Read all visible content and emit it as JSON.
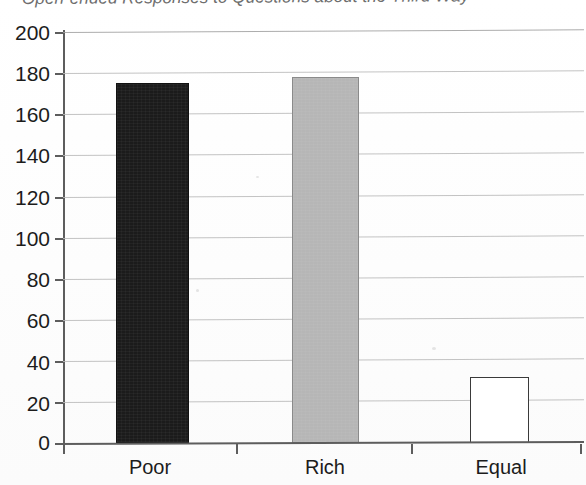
{
  "chart_data": {
    "type": "bar",
    "title": "Open-ended Responses to Questions about the Third Way",
    "xlabel": "",
    "ylabel": "",
    "categories": [
      "Poor",
      "Rich",
      "Equal"
    ],
    "values": [
      175,
      178,
      32
    ],
    "series": [
      {
        "name": "Responses",
        "values": [
          175,
          178,
          32
        ]
      }
    ],
    "ylim": [
      0,
      200
    ],
    "ytick_labels": [
      "200",
      "180",
      "160",
      "140",
      "120",
      "100",
      "80",
      "60",
      "40",
      "20",
      "0"
    ],
    "ytick_values": [
      200,
      180,
      160,
      140,
      120,
      100,
      80,
      60,
      40,
      20,
      0
    ],
    "ytick_step": 20,
    "grid": true,
    "grid_axis": "y",
    "legend": false,
    "legend_position": "none",
    "bar_colors": [
      "#1b1b1b",
      "#b6b6b6",
      "#ffffff"
    ],
    "bar_edge_colors": [
      "#111111",
      "#8a8a8a",
      "#3a3a3a"
    ],
    "annotations": []
  },
  "axis": {
    "y_axis_name": "y-axis",
    "x_axis_name": "x-axis"
  },
  "colors": {
    "grid": "#b9b9b9",
    "axis": "#5d5d5d",
    "text": "#1c1c1c",
    "title": "#4a4a4a",
    "background": "#ffffff"
  }
}
